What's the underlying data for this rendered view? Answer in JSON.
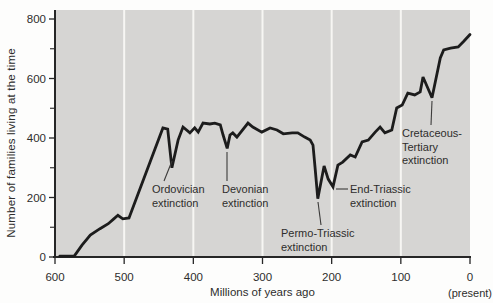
{
  "figure": {
    "kind": "annotated line chart of number of living families through geologic time with five mass extinctions marked"
  },
  "chart_data": {
    "type": "line",
    "title": "",
    "xlabel": "Millions of years ago",
    "ylabel": "Number of families living at the time",
    "x_axis": {
      "min": 600,
      "max": 0,
      "direction": "reversed (past to present, left to right)",
      "ticks": [
        600,
        500,
        400,
        300,
        200,
        100,
        0
      ],
      "present_note": "(present)"
    },
    "y_axis": {
      "min": 0,
      "max": 800,
      "ticks": [
        0,
        200,
        400,
        600,
        800
      ],
      "minor_ticks": [
        100,
        300,
        500,
        700
      ]
    },
    "grid": "vertical white gridlines on gray plot background",
    "gridlines_mya": [
      500,
      400,
      300,
      200,
      100
    ],
    "series": [
      {
        "name": "Number of families living at the time",
        "x_units": "millions of years ago",
        "y_units": "families",
        "points": [
          [
            593,
            3
          ],
          [
            572,
            4
          ],
          [
            561,
            40
          ],
          [
            549,
            74
          ],
          [
            535,
            95
          ],
          [
            523,
            112
          ],
          [
            515,
            128
          ],
          [
            509,
            140
          ],
          [
            502,
            128
          ],
          [
            493,
            131
          ],
          [
            444,
            434
          ],
          [
            437,
            430
          ],
          [
            431,
            300
          ],
          [
            422,
            393
          ],
          [
            415,
            437
          ],
          [
            405,
            417
          ],
          [
            398,
            434
          ],
          [
            393,
            420
          ],
          [
            386,
            450
          ],
          [
            376,
            447
          ],
          [
            369,
            450
          ],
          [
            361,
            444
          ],
          [
            357,
            410
          ],
          [
            351,
            365
          ],
          [
            347,
            410
          ],
          [
            343,
            417
          ],
          [
            337,
            403
          ],
          [
            321,
            450
          ],
          [
            314,
            437
          ],
          [
            301,
            420
          ],
          [
            289,
            434
          ],
          [
            279,
            427
          ],
          [
            270,
            414
          ],
          [
            257,
            417
          ],
          [
            249,
            417
          ],
          [
            239,
            403
          ],
          [
            231,
            393
          ],
          [
            227,
            376
          ],
          [
            224,
            299
          ],
          [
            220,
            196
          ],
          [
            211,
            306
          ],
          [
            205,
            262
          ],
          [
            198,
            236
          ],
          [
            191,
            309
          ],
          [
            184,
            319
          ],
          [
            173,
            343
          ],
          [
            166,
            336
          ],
          [
            156,
            387
          ],
          [
            147,
            393
          ],
          [
            137,
            420
          ],
          [
            130,
            437
          ],
          [
            123,
            417
          ],
          [
            113,
            427
          ],
          [
            106,
            501
          ],
          [
            98,
            511
          ],
          [
            90,
            551
          ],
          [
            80,
            545
          ],
          [
            72,
            555
          ],
          [
            68,
            605
          ],
          [
            55,
            535
          ],
          [
            43,
            669
          ],
          [
            38,
            696
          ],
          [
            28,
            702
          ],
          [
            17,
            706
          ],
          [
            9,
            725
          ],
          [
            0,
            748
          ]
        ]
      }
    ],
    "annotations": [
      {
        "id": "ordovician",
        "lines": [
          "Ordovician",
          "extinction"
        ],
        "target": {
          "mya": 431,
          "families": 300
        },
        "text_px": [
          152,
          183
        ],
        "leader_px": [
          164,
          181,
          172,
          161
        ]
      },
      {
        "id": "devonian",
        "lines": [
          "Devonian",
          "extinction"
        ],
        "target": {
          "mya": 351,
          "families": 365
        },
        "text_px": [
          222,
          183
        ],
        "leader_px": [
          227,
          181,
          227,
          152
        ]
      },
      {
        "id": "permo-triassic",
        "lines": [
          "Permo-Triassic",
          "extinction"
        ],
        "target": {
          "mya": 220,
          "families": 196
        },
        "text_px": [
          281,
          227
        ],
        "leader_px": [
          321,
          225,
          318,
          202
        ]
      },
      {
        "id": "end-triassic",
        "lines": [
          "End-Triassic",
          "extinction"
        ],
        "target": {
          "mya": 198,
          "families": 236
        },
        "text_px": [
          350,
          183
        ],
        "leader_px": [
          348,
          189,
          336,
          189
        ]
      },
      {
        "id": "cretaceous-tertiary",
        "lines": [
          "Cretaceous-",
          "Tertiary",
          "extinction"
        ],
        "target": {
          "mya": 55,
          "families": 535
        },
        "text_px": [
          402,
          127
        ],
        "leader_px": [
          431,
          125,
          432,
          101
        ]
      }
    ],
    "legend": "none",
    "colors": {
      "plot_bg": "#d6d5d3",
      "gridline": "#f7f6f3",
      "line": "#1c1c1c",
      "axis": "#262626",
      "text": "#2e2d2c",
      "leader": "#3c3b3a",
      "page_bg": "#fdfdfc"
    }
  }
}
